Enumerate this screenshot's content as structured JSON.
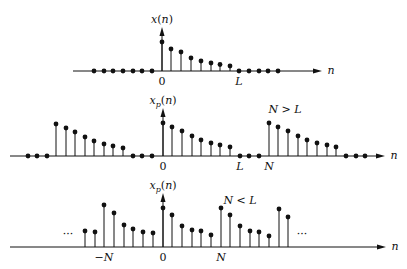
{
  "colors": {
    "ink": "#111111",
    "background": "#ffffff"
  },
  "plots": [
    {
      "id": "top",
      "ylabel": "x(n)",
      "xlabel": "n",
      "axis_y": 71,
      "axis_x0": 73,
      "axis_x1": 322,
      "origin_x": 162,
      "stems": [
        {
          "x": 162,
          "y": 42
        },
        {
          "x": 171,
          "y": 49
        },
        {
          "x": 181,
          "y": 52
        },
        {
          "x": 191,
          "y": 58
        },
        {
          "x": 201,
          "y": 61
        },
        {
          "x": 211,
          "y": 63
        },
        {
          "x": 220,
          "y": 64.5
        },
        {
          "x": 230,
          "y": 66
        }
      ],
      "dots": [
        94,
        104,
        113,
        123,
        133,
        142,
        152,
        239,
        249,
        259,
        268,
        278
      ],
      "ticks": [
        {
          "text": "0",
          "x": 162
        },
        {
          "text": "L",
          "x": 239
        }
      ]
    },
    {
      "id": "middle",
      "ylabel": "xp(n)",
      "xlabel": "n",
      "annotation": "N > L",
      "axis_y": 156,
      "axis_x0": 10,
      "axis_x1": 385,
      "origin_x": 163,
      "stems": [
        {
          "x": 56,
          "y": 124
        },
        {
          "x": 66,
          "y": 128
        },
        {
          "x": 75,
          "y": 132
        },
        {
          "x": 85,
          "y": 137
        },
        {
          "x": 94,
          "y": 141
        },
        {
          "x": 104,
          "y": 144
        },
        {
          "x": 113,
          "y": 146
        },
        {
          "x": 123,
          "y": 148
        },
        {
          "x": 163,
          "y": 123
        },
        {
          "x": 172,
          "y": 127
        },
        {
          "x": 182,
          "y": 131
        },
        {
          "x": 192,
          "y": 136
        },
        {
          "x": 201,
          "y": 140
        },
        {
          "x": 211,
          "y": 143
        },
        {
          "x": 220,
          "y": 145
        },
        {
          "x": 230,
          "y": 147
        },
        {
          "x": 269,
          "y": 123
        },
        {
          "x": 278,
          "y": 127
        },
        {
          "x": 288,
          "y": 131
        },
        {
          "x": 298,
          "y": 136
        },
        {
          "x": 307,
          "y": 140
        },
        {
          "x": 317,
          "y": 143
        },
        {
          "x": 327,
          "y": 145
        },
        {
          "x": 336,
          "y": 147
        }
      ],
      "dots": [
        28,
        37,
        47,
        133,
        142,
        152,
        240,
        249,
        259,
        346,
        356,
        365
      ],
      "ticks": [
        {
          "text": "0",
          "x": 163
        },
        {
          "text": "L",
          "x": 240
        },
        {
          "text": "N",
          "x": 269
        }
      ]
    },
    {
      "id": "bottom",
      "ylabel": "xp(n)",
      "xlabel": "n",
      "annotation": "N < L",
      "ellipsis": "···",
      "axis_y": 247,
      "axis_x0": 10,
      "axis_x1": 386,
      "origin_x": 163,
      "stems": [
        {
          "x": 85,
          "y": 231
        },
        {
          "x": 95,
          "y": 232
        },
        {
          "x": 104,
          "y": 205
        },
        {
          "x": 114,
          "y": 213
        },
        {
          "x": 124,
          "y": 225
        },
        {
          "x": 133,
          "y": 229
        },
        {
          "x": 143,
          "y": 232
        },
        {
          "x": 153,
          "y": 233
        },
        {
          "x": 163,
          "y": 208
        },
        {
          "x": 172,
          "y": 215
        },
        {
          "x": 182,
          "y": 226
        },
        {
          "x": 192,
          "y": 230
        },
        {
          "x": 201,
          "y": 231
        },
        {
          "x": 211,
          "y": 235
        },
        {
          "x": 221,
          "y": 208
        },
        {
          "x": 230,
          "y": 215
        },
        {
          "x": 240,
          "y": 226
        },
        {
          "x": 250,
          "y": 231
        },
        {
          "x": 259,
          "y": 232
        },
        {
          "x": 269,
          "y": 236
        },
        {
          "x": 279,
          "y": 209
        },
        {
          "x": 288,
          "y": 217
        }
      ],
      "dots": [],
      "ticks": [
        {
          "text": "−N",
          "x": 104
        },
        {
          "text": "0",
          "x": 163
        },
        {
          "text": "N",
          "x": 221
        }
      ]
    }
  ]
}
